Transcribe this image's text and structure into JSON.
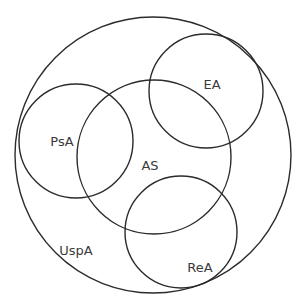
{
  "diagram": {
    "type": "venn",
    "stroke_color": "#2b2b2b",
    "label_color": "#3a3a3a",
    "background_color": "#ffffff",
    "sets": [
      {
        "id": "uspa",
        "label": "UspA",
        "role": "outer-container"
      },
      {
        "id": "psa",
        "label": "PsA",
        "role": "subset"
      },
      {
        "id": "as",
        "label": "AS",
        "role": "subset"
      },
      {
        "id": "ea",
        "label": "EA",
        "role": "subset"
      },
      {
        "id": "rea",
        "label": "ReA",
        "role": "subset"
      }
    ],
    "overlaps": [
      [
        "psa",
        "as"
      ],
      [
        "ea",
        "as"
      ],
      [
        "rea",
        "as"
      ]
    ]
  }
}
